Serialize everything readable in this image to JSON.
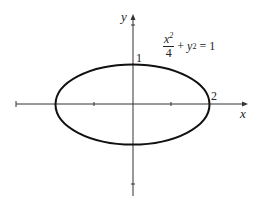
{
  "diagram": {
    "equation": {
      "numerator": "x",
      "num_exp": "2",
      "denominator": "4",
      "rest_var": "y",
      "rest_exp": "2",
      "rest": "= 1",
      "plus": "+"
    },
    "x_axis_label": "x",
    "y_axis_label": "y",
    "semi_major_label": "2",
    "semi_minor_label": "1",
    "a": 2,
    "b": 1,
    "colors": {
      "axis": "#333333",
      "curve": "#111111"
    }
  }
}
